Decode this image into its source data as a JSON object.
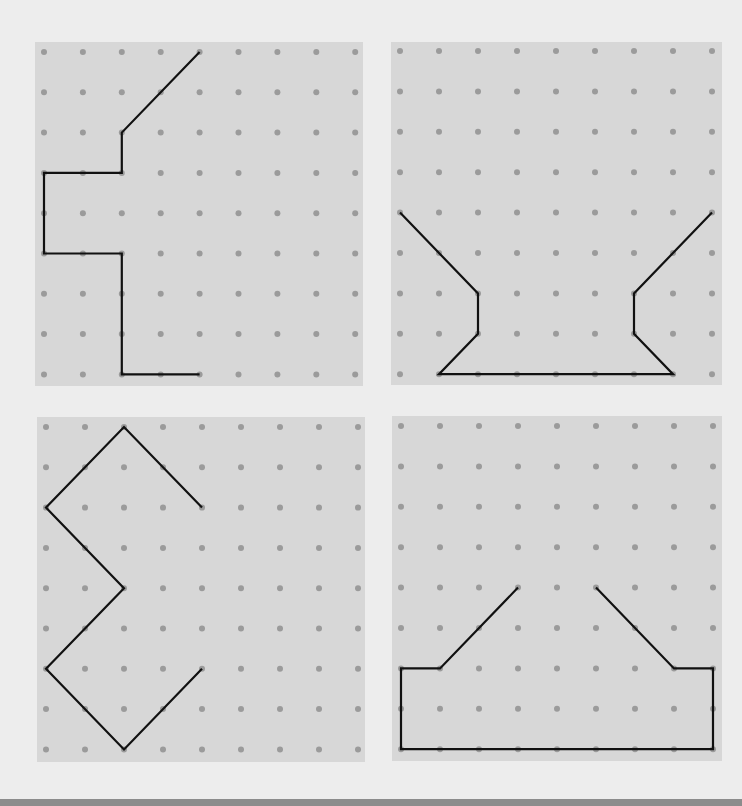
{
  "colors": {
    "page_background": "#ededed",
    "panel_background": "#d7d7d7",
    "dot": "#9b9b9b",
    "line": "#111111",
    "bottom_bar": "#8c8c8c"
  },
  "grid": {
    "columns": 9,
    "rows": 9,
    "dot_radius": 3
  },
  "panels": [
    {
      "id": "top-left",
      "box": {
        "left": 35,
        "top": 42,
        "width": 328,
        "height": 344
      },
      "first_dot": {
        "x": 9,
        "y": 10
      },
      "step": {
        "x": 38.9,
        "y": 40.3
      },
      "path": [
        [
          4,
          0
        ],
        [
          2,
          2
        ],
        [
          2,
          3
        ],
        [
          0,
          3
        ],
        [
          0,
          5
        ],
        [
          2,
          5
        ],
        [
          2,
          8
        ],
        [
          4,
          8
        ]
      ]
    },
    {
      "id": "top-right",
      "box": {
        "left": 391,
        "top": 42,
        "width": 331,
        "height": 343
      },
      "first_dot": {
        "x": 9,
        "y": 9
      },
      "step": {
        "x": 39.0,
        "y": 40.4
      },
      "path": [
        [
          0,
          4
        ],
        [
          2,
          6
        ],
        [
          2,
          7
        ],
        [
          1,
          8
        ],
        [
          7,
          8
        ],
        [
          6,
          7
        ],
        [
          6,
          6
        ],
        [
          8,
          4
        ]
      ]
    },
    {
      "id": "bottom-left",
      "box": {
        "left": 37,
        "top": 417,
        "width": 328,
        "height": 345
      },
      "first_dot": {
        "x": 9,
        "y": 10
      },
      "step": {
        "x": 39.0,
        "y": 40.3
      },
      "path": [
        [
          4,
          2
        ],
        [
          2,
          0
        ],
        [
          0,
          2
        ],
        [
          2,
          4
        ],
        [
          0,
          6
        ],
        [
          2,
          8
        ],
        [
          4,
          6
        ]
      ]
    },
    {
      "id": "bottom-right",
      "box": {
        "left": 392,
        "top": 416,
        "width": 330,
        "height": 345
      },
      "first_dot": {
        "x": 9,
        "y": 10
      },
      "step": {
        "x": 39.0,
        "y": 40.4
      },
      "path": [
        [
          3,
          4
        ],
        [
          1,
          6
        ],
        [
          0,
          6
        ],
        [
          0,
          8
        ],
        [
          8,
          8
        ],
        [
          8,
          6
        ],
        [
          7,
          6
        ],
        [
          5,
          4
        ]
      ]
    }
  ]
}
